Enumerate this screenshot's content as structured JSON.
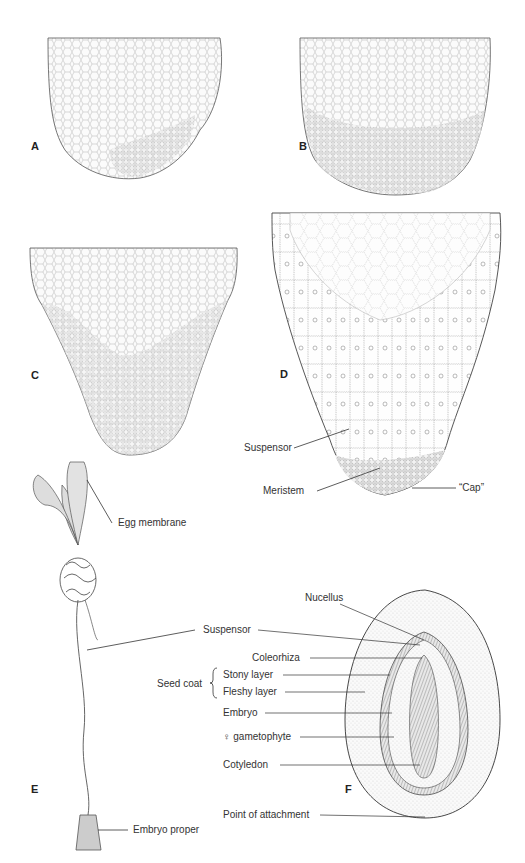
{
  "figure": {
    "panels": [
      {
        "id": "A",
        "letter": "A"
      },
      {
        "id": "B",
        "letter": "B"
      },
      {
        "id": "C",
        "letter": "C"
      },
      {
        "id": "D",
        "letter": "D"
      },
      {
        "id": "E",
        "letter": "E"
      },
      {
        "id": "F",
        "letter": "F"
      }
    ],
    "labels": {
      "suspensor_d": "Suspensor",
      "meristem": "Meristem",
      "cap": "“Cap”",
      "egg_membrane": "Egg membrane",
      "suspensor_ef": "Suspensor",
      "embryo_proper": "Embryo proper",
      "nucellus": "Nucellus",
      "coleorhiza": "Coleorhiza",
      "seed_coat": "Seed coat",
      "stony_layer": "Stony layer",
      "fleshy_layer": "Fleshy layer",
      "embryo": "Embryo",
      "female_gametophyte": "♀ gametophyte",
      "cotyledon": "Cotyledon",
      "point_of_attachment": "Point of attachment"
    }
  }
}
